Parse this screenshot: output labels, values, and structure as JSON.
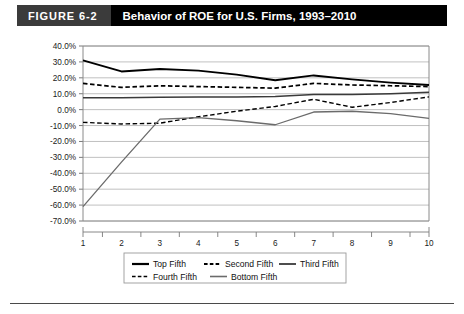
{
  "header": {
    "figure_tag": "FIGURE 6-2",
    "title": "Behavior of ROE for U.S. Firms, 1993–2010"
  },
  "chart_data": {
    "type": "line",
    "title": "Behavior of ROE for U.S. Firms, 1993–2010",
    "xlabel": "",
    "ylabel": "",
    "x": [
      1,
      2,
      3,
      4,
      5,
      6,
      7,
      8,
      9,
      10
    ],
    "categories": [
      "1",
      "2",
      "3",
      "4",
      "5",
      "6",
      "7",
      "8",
      "9",
      "10"
    ],
    "xtick_labels": [
      "1",
      "2",
      "3",
      "4",
      "5",
      "6",
      "7",
      "8",
      "9",
      "10"
    ],
    "ytick_labels": [
      "40.0%",
      "30.0%",
      "20.0%",
      "10.0%",
      "0.0%",
      "-10.0%",
      "-20.0%",
      "-30.0%",
      "-40.0%",
      "-50.0%",
      "-60.0%",
      "-70.0%"
    ],
    "ytick_values": [
      40,
      30,
      20,
      10,
      0,
      -10,
      -20,
      -30,
      -40,
      -50,
      -60,
      -70
    ],
    "ylim": [
      -70,
      40
    ],
    "xlim": [
      1,
      10
    ],
    "grid": true,
    "legend_position": "bottom",
    "series": [
      {
        "name": "Top Fifth",
        "values": [
          31.0,
          24.0,
          25.5,
          24.5,
          22.0,
          18.5,
          21.5,
          19.0,
          17.0,
          15.5
        ],
        "style": "solid",
        "color": "#000000",
        "width": 1.9
      },
      {
        "name": "Second Fifth",
        "values": [
          16.5,
          14.0,
          15.0,
          14.5,
          14.0,
          13.5,
          16.5,
          15.5,
          15.0,
          14.5
        ],
        "style": "dashed",
        "color": "#000000",
        "width": 1.7
      },
      {
        "name": "Third Fifth",
        "values": [
          7.5,
          7.5,
          7.8,
          8.0,
          8.0,
          8.2,
          9.5,
          9.5,
          10.0,
          11.0
        ],
        "style": "solid",
        "color": "#3a3a3a",
        "width": 1.5
      },
      {
        "name": "Fourth Fifth",
        "values": [
          -8.0,
          -9.0,
          -8.5,
          -4.5,
          -1.0,
          2.0,
          6.5,
          1.5,
          4.5,
          8.0
        ],
        "style": "dashed",
        "color": "#000000",
        "width": 1.4
      },
      {
        "name": "Bottom Fifth",
        "values": [
          -61.0,
          -33.0,
          -6.0,
          -5.0,
          -7.0,
          -9.5,
          -1.5,
          -1.0,
          -2.5,
          -5.5
        ],
        "style": "solid",
        "color": "#6b6b6b",
        "width": 1.3
      }
    ]
  }
}
